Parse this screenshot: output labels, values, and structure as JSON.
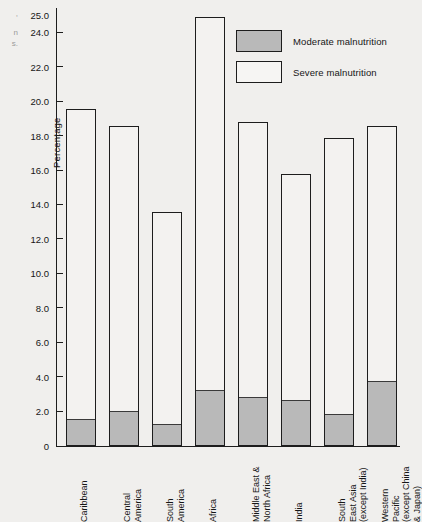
{
  "edge_fragments": {
    "line1": ",",
    "line2": "n",
    "line3": "s."
  },
  "chart_data": {
    "type": "bar",
    "stacked": true,
    "title": "",
    "xlabel": "",
    "ylabel": "Percentage",
    "ylim": [
      0,
      25.5
    ],
    "yticks": [
      0,
      2.0,
      4.0,
      6.0,
      8.0,
      10.0,
      12.0,
      14.0,
      16.0,
      18.0,
      20.0,
      22.0,
      24.0,
      25.0
    ],
    "ytick_labels": [
      "0",
      "2.0",
      "4.0",
      "6.0",
      "8.0",
      "10.0",
      "12.0",
      "14.0",
      "16.0",
      "18.0",
      "20.0",
      "22.0",
      "24.0",
      "25.0"
    ],
    "grid": false,
    "legend_position": "top-right",
    "categories": [
      "Caribbean",
      "Central America",
      "South America",
      "Africa",
      "Middle East & North Africa",
      "India",
      "South East Asia (except India)",
      "Western Pacific (except China & Japan)"
    ],
    "category_label_lines": [
      [
        "Caribbean"
      ],
      [
        "Central",
        "America"
      ],
      [
        "South",
        "America"
      ],
      [
        "Africa"
      ],
      [
        "Middle East &",
        "North Africa"
      ],
      [
        "India"
      ],
      [
        "South",
        "East Asia",
        "(except India)"
      ],
      [
        "Western",
        "Pacific",
        "(except China",
        "& Japan)"
      ]
    ],
    "series": [
      {
        "name": "Moderate malnutrition",
        "color": "#b9b9b9",
        "values": [
          1.5,
          2.0,
          1.2,
          3.2,
          2.8,
          2.6,
          1.8,
          3.7
        ]
      },
      {
        "name": "Severe malnutrition",
        "color": "#f6f5f3",
        "values": [
          18.1,
          16.6,
          12.4,
          21.7,
          16.0,
          13.2,
          16.1,
          14.9
        ]
      }
    ],
    "totals": [
      19.6,
      18.6,
      13.6,
      24.9,
      18.8,
      15.8,
      17.9,
      18.6
    ]
  },
  "legend": {
    "items": [
      {
        "label": "Moderate malnutrition",
        "key": "moderate"
      },
      {
        "label": "Severe malnutrition",
        "key": "severe"
      }
    ]
  }
}
